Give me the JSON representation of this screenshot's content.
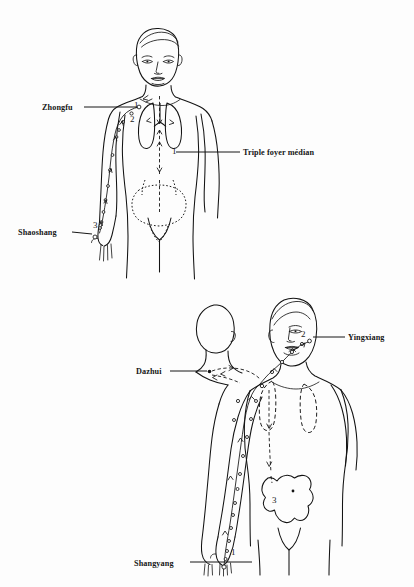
{
  "page": {
    "background_color": "#fdfdfd",
    "ink_color": "#131313",
    "width": 414,
    "height": 587
  },
  "figures": [
    {
      "id": "upper",
      "name": "lung-meridian-figure",
      "view": "anterior",
      "description": "Front view of male torso showing the Lung meridian pathway down the left arm, with lungs and abdominal organ outlines",
      "labels": [
        {
          "id": "zhongfu",
          "text": "Zhongfu",
          "x": 42,
          "y": 110,
          "anchor": "start",
          "leader": {
            "x1": 84,
            "y1": 107,
            "x2": 137,
            "y2": 107
          }
        },
        {
          "id": "triple-foyer",
          "text": "Triple foyer médian",
          "x": 243,
          "y": 155,
          "anchor": "start",
          "leader": {
            "x1": 176,
            "y1": 152,
            "x2": 240,
            "y2": 152
          }
        },
        {
          "id": "shaoshang",
          "text": "Shaoshang",
          "x": 18,
          "y": 235,
          "anchor": "start",
          "leader": {
            "x1": 72,
            "y1": 232,
            "x2": 89,
            "y2": 232
          }
        }
      ],
      "point_numbers": [
        {
          "text": "1",
          "x": 134,
          "y": 108
        },
        {
          "text": "2",
          "x": 130,
          "y": 122
        },
        {
          "text": "3",
          "x": 93,
          "y": 228
        },
        {
          "text": "1",
          "x": 172,
          "y": 154
        }
      ]
    },
    {
      "id": "lower",
      "name": "large-intestine-meridian-figure",
      "view": "posterior-oblique",
      "description": "Oblique back view showing the Large Intestine meridian from the index finger up the arm to the face, with lungs and colon outlines",
      "labels": [
        {
          "id": "yingxiang",
          "text": "Yingxiang",
          "x": 348,
          "y": 340,
          "anchor": "start",
          "leader": {
            "x1": 313,
            "y1": 337,
            "x2": 345,
            "y2": 337
          }
        },
        {
          "id": "dazhui",
          "text": "Dazhui",
          "x": 136,
          "y": 374,
          "anchor": "start",
          "leader": {
            "x1": 170,
            "y1": 371,
            "x2": 207,
            "y2": 371
          }
        },
        {
          "id": "shangyang",
          "text": "Shangyang",
          "x": 134,
          "y": 566,
          "anchor": "start",
          "leader": {
            "x1": 190,
            "y1": 562,
            "x2": 250,
            "y2": 562
          }
        }
      ],
      "point_numbers": [
        {
          "text": "1",
          "x": 231,
          "y": 555
        },
        {
          "text": "2",
          "x": 303,
          "y": 337
        },
        {
          "text": "3",
          "x": 275,
          "y": 500
        }
      ]
    }
  ],
  "legend_terms": {
    "zhongfu": "Zhongfu",
    "shaoshang": "Shaoshang",
    "triple_foyer": "Triple foyer médian",
    "yingxiang": "Yingxiang",
    "dazhui": "Dazhui",
    "shangyang": "Shangyang"
  }
}
